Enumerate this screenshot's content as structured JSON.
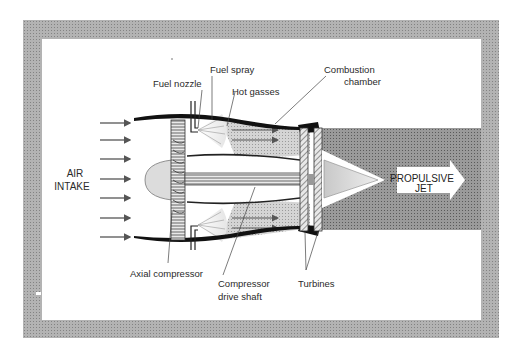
{
  "diagram": {
    "colors": {
      "frame": "#a8a8a8",
      "background": "#ffffff",
      "jet": "#8f8f8f",
      "hot_gas": "#cfcfcf",
      "casing": "#111111"
    },
    "labels": {
      "fuel_nozzle": "Fuel nozzle",
      "fuel_spray": "Fuel spray",
      "hot_gasses": "Hot gasses",
      "combustion_chamber_1": "Combustion",
      "combustion_chamber_2": "chamber",
      "air_intake_1": "AIR",
      "air_intake_2": "INTAKE",
      "propulsive_jet_1": "PROPULSIVE",
      "propulsive_jet_2": "JET",
      "axial_compressor": "Axial compressor",
      "compressor_drive_shaft_1": "Compressor",
      "compressor_drive_shaft_2": "drive shaft",
      "turbines": "Turbines"
    },
    "intake_arrows": 7
  }
}
